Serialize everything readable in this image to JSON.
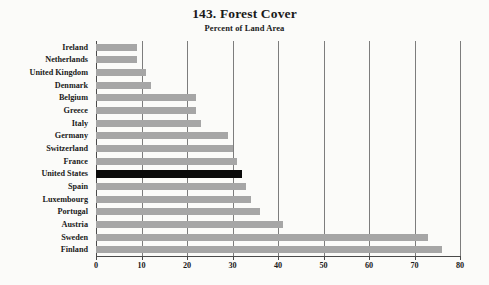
{
  "chart_data": {
    "type": "bar",
    "orientation": "horizontal",
    "title": "143. Forest Cover",
    "subtitle": "Percent of Land Area",
    "xlabel": "",
    "ylabel": "",
    "xlim": [
      0,
      80
    ],
    "xticks": [
      0,
      10,
      20,
      30,
      40,
      50,
      60,
      70,
      80
    ],
    "xtick_labels": [
      "0",
      "10",
      "20",
      "30",
      "40",
      "50",
      "60",
      "70",
      "80"
    ],
    "grid": true,
    "legend": false,
    "highlight_category": "United States",
    "bar_color": "#a6a6a6",
    "highlight_color": "#0a0a0a",
    "categories": [
      "Ireland",
      "Netherlands",
      "United Kingdom",
      "Denmark",
      "Belgium",
      "Greece",
      "Italy",
      "Germany",
      "Switzerland",
      "France",
      "United States",
      "Spain",
      "Luxembourg",
      "Portugal",
      "Austria",
      "Sweden",
      "Finland"
    ],
    "values": [
      9,
      9,
      11,
      12,
      22,
      22,
      23,
      29,
      30,
      31,
      32,
      33,
      34,
      36,
      41,
      73,
      76
    ]
  }
}
